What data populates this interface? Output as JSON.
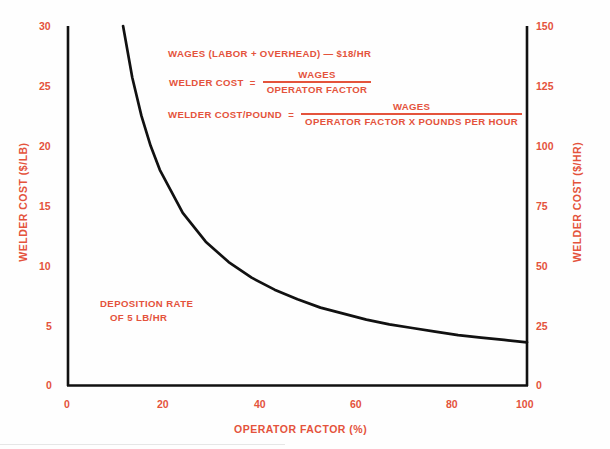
{
  "chart_data": {
    "type": "line",
    "title": "",
    "xlabel": "OPERATOR FACTOR (%)",
    "ylabel": "WELDER COST ($/LB)",
    "ylabel_right": "WELDER COST ($/HR)",
    "xlim": [
      0,
      100
    ],
    "ylim": [
      0,
      30
    ],
    "ylim_right": [
      0,
      150
    ],
    "grid": false,
    "legend": null,
    "xticks": [
      "0",
      "20",
      "40",
      "60",
      "80",
      "100"
    ],
    "xtick_values": [
      0,
      20,
      40,
      60,
      80,
      100
    ],
    "yticks_left": [
      "0",
      "5",
      "10",
      "15",
      "20",
      "25",
      "30"
    ],
    "ytick_values_left": [
      0,
      5,
      10,
      15,
      20,
      25,
      30
    ],
    "yticks_right": [
      "0",
      "25",
      "50",
      "75",
      "100",
      "125",
      "150"
    ],
    "ytick_values_right": [
      0,
      25,
      50,
      75,
      100,
      125,
      150
    ],
    "series": [
      {
        "name": "Welder cost vs operator factor",
        "relation": "cost_per_lb = 18 / (operator_factor_fraction * 5)",
        "x": [
          12,
          14,
          16,
          18,
          20,
          25,
          30,
          35,
          40,
          45,
          50,
          55,
          60,
          65,
          70,
          75,
          80,
          85,
          90,
          95,
          100
        ],
        "values": [
          30.0,
          25.7,
          22.5,
          20.0,
          18.0,
          14.4,
          12.0,
          10.3,
          9.0,
          8.0,
          7.2,
          6.5,
          6.0,
          5.5,
          5.1,
          4.8,
          4.5,
          4.2,
          4.0,
          3.8,
          3.6
        ]
      }
    ],
    "annotations": [
      "WAGES (LABOR + OVERHEAD) — $18/HR",
      "WELDER COST = WAGES / OPERATOR FACTOR",
      "WELDER COST/POUND = WAGES / (OPERATOR FACTOR X POUNDS PER HOUR)",
      "DEPOSITION RATE OF 5 LB/HR"
    ]
  },
  "axes": {
    "y_left_title": "WELDER COST ($/LB)",
    "y_right_title": "WELDER COST ($/HR)",
    "x_title": "OPERATOR FACTOR (%)",
    "x_ticks": [
      "0",
      "20",
      "40",
      "60",
      "80",
      "100"
    ],
    "y_left_ticks": [
      "30",
      "25",
      "20",
      "15",
      "10",
      "5",
      "0"
    ],
    "y_right_ticks": [
      "150",
      "125",
      "100",
      "75",
      "50",
      "25",
      "0"
    ]
  },
  "equations": {
    "wages_line": "WAGES (LABOR + OVERHEAD) — $18/HR",
    "eq2_lhs": "WELDER COST",
    "eq2_eq": "=",
    "eq2_num": "WAGES",
    "eq2_den": "OPERATOR FACTOR",
    "eq3_lhs": "WELDER COST/POUND",
    "eq3_eq": "=",
    "eq3_num": "WAGES",
    "eq3_den": "OPERATOR FACTOR X POUNDS PER HOUR"
  },
  "deposition_note": {
    "line1": "DEPOSITION RATE",
    "line2": "OF 5 LB/HR"
  },
  "colors": {
    "text_red": "#e4533c",
    "curve_black": "#111111",
    "background": "#fefefe"
  }
}
